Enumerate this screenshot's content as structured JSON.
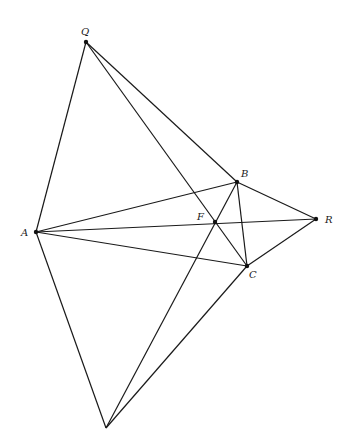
{
  "diagram": {
    "points": {
      "Q": {
        "label": "Q",
        "x": 86,
        "y": 42,
        "lx": 81,
        "ly": 35
      },
      "A": {
        "label": "A",
        "x": 36,
        "y": 232,
        "lx": 21,
        "ly": 236
      },
      "B": {
        "label": "B",
        "x": 237,
        "y": 182,
        "lx": 241,
        "ly": 177
      },
      "C": {
        "label": "C",
        "x": 247,
        "y": 266,
        "lx": 249,
        "ly": 278
      },
      "R": {
        "label": "R",
        "x": 316,
        "y": 219,
        "lx": 325,
        "ly": 223
      },
      "F": {
        "label": "F",
        "x": 215,
        "y": 222,
        "lx": 197,
        "ly": 220
      },
      "P": {
        "label": "",
        "x": 106,
        "y": 428
      }
    },
    "segments": [
      [
        "Q",
        "A"
      ],
      [
        "Q",
        "B"
      ],
      [
        "Q",
        "C"
      ],
      [
        "A",
        "B"
      ],
      [
        "A",
        "R"
      ],
      [
        "A",
        "C"
      ],
      [
        "A",
        "P"
      ],
      [
        "B",
        "R"
      ],
      [
        "B",
        "C"
      ],
      [
        "C",
        "R"
      ],
      [
        "B",
        "P"
      ],
      [
        "C",
        "P"
      ]
    ],
    "labels": [
      "Q",
      "A",
      "B",
      "C",
      "R",
      "F"
    ]
  }
}
